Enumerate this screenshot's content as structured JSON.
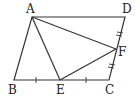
{
  "diagram": {
    "type": "geometry",
    "shape": "parallelogram ABCD",
    "points": {
      "A": {
        "label": "A",
        "x": 32,
        "y": 17
      },
      "B": {
        "label": "B",
        "x": 14,
        "y": 80
      },
      "C": {
        "label": "C",
        "x": 109,
        "y": 80
      },
      "D": {
        "label": "D",
        "x": 125,
        "y": 17
      },
      "E": {
        "label": "E",
        "x": 60,
        "y": 80
      },
      "F": {
        "label": "F",
        "x": 116,
        "y": 49
      }
    },
    "segments": [
      "AB",
      "BC",
      "CD",
      "DA",
      "AE",
      "AF",
      "EF"
    ],
    "equal_marks": {
      "single": [
        "BE",
        "EC"
      ],
      "double": [
        "DF",
        "FC"
      ]
    },
    "stroke_color": "#333333"
  }
}
